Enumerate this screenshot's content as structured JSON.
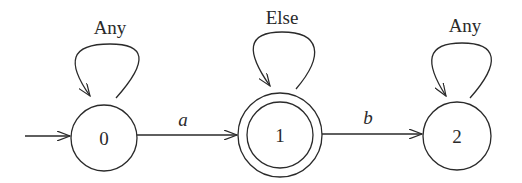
{
  "diagram": {
    "type": "finite-state-automaton",
    "initial_state": "0",
    "states": [
      {
        "id": "0",
        "label": "0",
        "accepting": false,
        "self_loop_label": "Any"
      },
      {
        "id": "1",
        "label": "1",
        "accepting": true,
        "self_loop_label": "Else"
      },
      {
        "id": "2",
        "label": "2",
        "accepting": false,
        "self_loop_label": "Any"
      }
    ],
    "transitions": [
      {
        "from": "0",
        "to": "1",
        "label": "a"
      },
      {
        "from": "1",
        "to": "2",
        "label": "b"
      }
    ],
    "colors": {
      "stroke": "#2a2a2a",
      "background": "#ffffff"
    }
  }
}
